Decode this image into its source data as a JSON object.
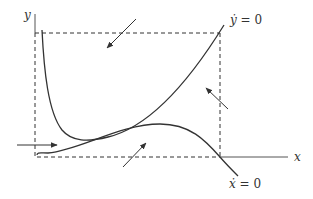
{
  "diagram": {
    "type": "phase-plane",
    "axes": {
      "x_label": "x",
      "y_label": "y"
    },
    "nullclines": [
      {
        "id": "y-dot-nullcline",
        "label_var": "ẏ",
        "label_rest": " = 0"
      },
      {
        "id": "x-dot-nullcline",
        "label_var": "ẋ",
        "label_rest": " = 0"
      }
    ],
    "direction_arrows": [
      {
        "id": "arrow-top",
        "direction": "down-left"
      },
      {
        "id": "arrow-right",
        "direction": "up-left"
      },
      {
        "id": "arrow-bottom",
        "direction": "up-right"
      },
      {
        "id": "arrow-left",
        "direction": "right"
      }
    ],
    "colors": {
      "ink": "#333333",
      "background": "#ffffff"
    }
  }
}
